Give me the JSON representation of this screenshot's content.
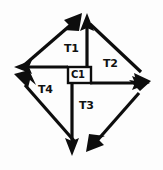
{
  "diagram": {
    "shape": "diamond",
    "stroke_color": "#0d0d0d",
    "background_color": "#fdfdfd",
    "center": {
      "label": "C1",
      "box": {
        "x": 68,
        "y": 67,
        "width": 23,
        "height": 16
      }
    },
    "regions": [
      {
        "id": "T1",
        "label": "T1",
        "position": "top-left"
      },
      {
        "id": "T2",
        "label": "T2",
        "position": "top-right"
      },
      {
        "id": "T3",
        "label": "T3",
        "position": "bottom-right"
      },
      {
        "id": "T4",
        "label": "T4",
        "position": "bottom-left"
      }
    ],
    "vertices": [
      {
        "id": "top",
        "x": 81,
        "y": 14
      },
      {
        "id": "right",
        "x": 149,
        "y": 83
      },
      {
        "id": "bottom",
        "x": 81,
        "y": 155
      },
      {
        "id": "left",
        "x": 14,
        "y": 70
      }
    ],
    "arrows": [
      {
        "id": "diagonal-up-right",
        "from": "left-vertex",
        "to": "top-vertex",
        "direction": "up-right"
      },
      {
        "id": "diagonal-down-right",
        "from": "top-vertex",
        "to": "right-vertex",
        "direction": "down-right"
      },
      {
        "id": "diagonal-down-left",
        "from": "right-vertex",
        "to": "bottom-vertex",
        "direction": "down-left"
      },
      {
        "id": "diagonal-up-left",
        "from": "bottom-vertex",
        "to": "left-vertex",
        "direction": "up-left"
      },
      {
        "id": "internal-up",
        "from": "center",
        "to": "top-vertex",
        "direction": "up"
      },
      {
        "id": "internal-right",
        "from": "center",
        "to": "right-vertex",
        "direction": "right"
      },
      {
        "id": "internal-down",
        "from": "center",
        "to": "bottom-vertex",
        "direction": "down"
      },
      {
        "id": "internal-left",
        "from": "center",
        "to": "left-vertex",
        "direction": "left"
      }
    ]
  }
}
